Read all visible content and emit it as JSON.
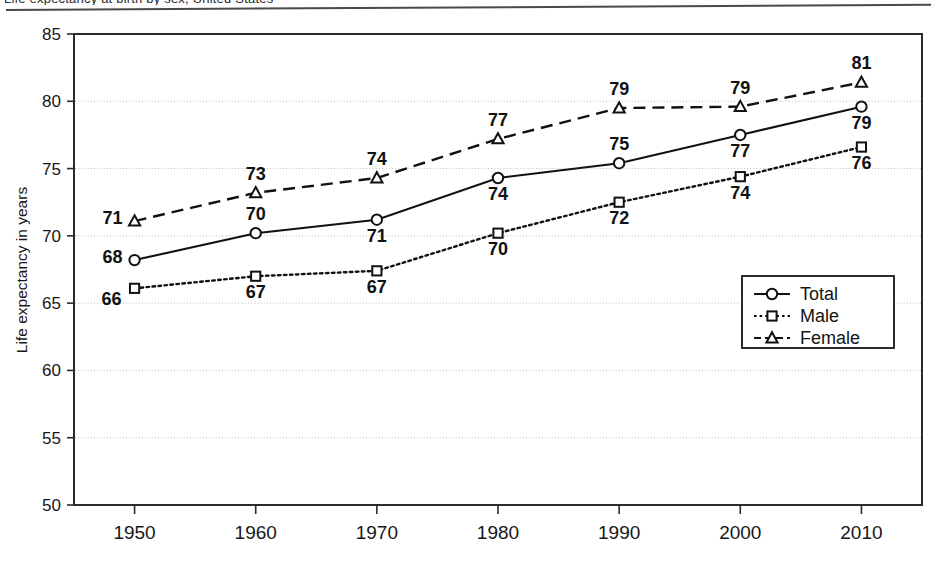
{
  "page": {
    "top_caption_partial": "Life expectancy at birth by sex, United States",
    "has_top_rule": true
  },
  "colors": {
    "ink": "#111111",
    "frame": "#2b2b2b",
    "gridline": "#b9b9b9",
    "background": "#ffffff"
  },
  "legend": {
    "position": "inside-right-middle",
    "entries": [
      {
        "label": "Total",
        "marker": "circle-marker",
        "line_style": "solid"
      },
      {
        "label": "Male",
        "marker": "square-marker",
        "line_style": "dotted"
      },
      {
        "label": "Female",
        "marker": "triangle-marker",
        "line_style": "dashed"
      }
    ]
  },
  "chart_data": {
    "type": "line",
    "title": "",
    "subtitle": "",
    "xlabel": "",
    "ylabel": "Life expectancy in years",
    "x": [
      1950,
      1960,
      1970,
      1980,
      1990,
      2000,
      2010
    ],
    "categories": [
      "1950",
      "1960",
      "1970",
      "1980",
      "1990",
      "2000",
      "2010"
    ],
    "xtick_labels": [
      "1950",
      "1960",
      "1970",
      "1980",
      "1990",
      "2000",
      "2010"
    ],
    "ytick_labels": [
      "85",
      "80",
      "75",
      "70",
      "65",
      "60",
      "55",
      "50"
    ],
    "yticks": [
      85,
      80,
      75,
      70,
      65,
      60,
      55,
      50
    ],
    "ylim": [
      50,
      85
    ],
    "xlim": [
      1945,
      2015
    ],
    "grid": true,
    "grid_axis": "y",
    "legend_position": "center right",
    "series": [
      {
        "name": "Total",
        "marker": "circle",
        "line_style": "solid",
        "values": [
          68.2,
          70.2,
          71.2,
          74.3,
          75.4,
          77.5,
          79.6
        ],
        "labels": [
          "68",
          "70",
          "71",
          "74",
          "75",
          "77",
          "79"
        ],
        "label_positions": [
          "left",
          "above",
          "below",
          "below",
          "above",
          "below",
          "below"
        ]
      },
      {
        "name": "Male",
        "marker": "square",
        "line_style": "dotted",
        "values": [
          66.1,
          67.0,
          67.4,
          70.2,
          72.5,
          74.4,
          76.6
        ],
        "labels": [
          "66",
          "67",
          "67",
          "70",
          "72",
          "74",
          "76"
        ],
        "label_positions": [
          "below-left",
          "below",
          "below",
          "below",
          "below",
          "below",
          "below"
        ]
      },
      {
        "name": "Female",
        "marker": "triangle",
        "line_style": "dashed",
        "values": [
          71.1,
          73.2,
          74.3,
          77.2,
          79.5,
          79.6,
          81.4
        ],
        "labels": [
          "71",
          "73",
          "74",
          "77",
          "79",
          "79",
          "81"
        ],
        "label_positions": [
          "left",
          "above",
          "above",
          "above",
          "above",
          "above",
          "above"
        ]
      }
    ]
  }
}
